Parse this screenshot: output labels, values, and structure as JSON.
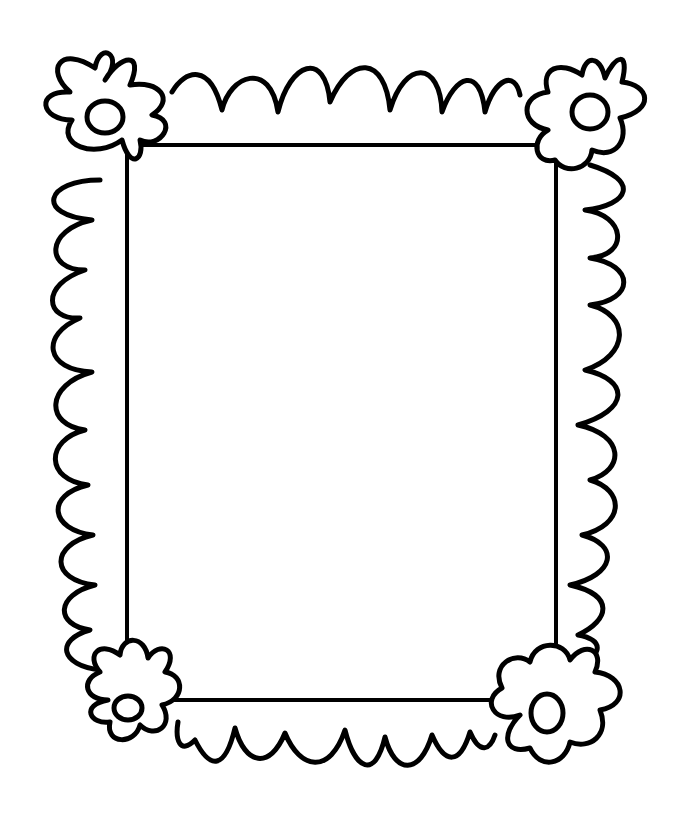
{
  "image": {
    "subject": "decorative scalloped picture frame with flowers at the four corners",
    "width": 700,
    "height": 835,
    "background": "#ffffff",
    "stroke_color": "#000000",
    "stroke_width": 5
  },
  "inner_rectangle": {
    "x": 127,
    "y": 145,
    "width": 429,
    "height": 555
  },
  "scallop_edges": {
    "top": "M 172 92 C 185 70, 210 62, 222 110 C 230 75, 270 60, 278 112 C 290 62, 325 50, 330 102 C 350 55, 385 55, 390 110 C 405 60, 440 60, 442 112 C 455 75, 480 65, 485 112 C 495 78, 515 70, 520 95",
    "bottom": "M 178 722 C 175 740, 180 755, 195 740 C 210 770, 225 770, 235 728 C 245 765, 270 770, 285 733 C 300 770, 330 775, 345 730 C 355 770, 375 780, 385 737 C 395 775, 420 775, 432 735 C 445 765, 460 765, 470 732 C 480 755, 490 750, 495 735",
    "left": "M 100 180 C 45 180, 35 215, 92 220 C 45 230, 45 270, 85 270 C 40 285, 45 320, 80 318 C 40 335, 45 370, 92 372 C 45 385, 45 425, 85 430 C 45 440, 45 480, 88 485 C 45 495, 50 530, 93 535 C 50 545, 50 580, 95 585 C 55 595, 55 625, 90 630 C 55 640, 60 665, 100 670",
    "right": "M 590 165 C 640 180, 630 205, 585 210 C 625 215, 630 255, 590 258 C 635 265, 635 300, 590 305 C 630 315, 630 355, 585 370 C 630 380, 630 410, 578 425 C 625 435, 625 470, 590 480 C 625 490, 625 525, 582 535 C 620 545, 615 575, 570 585 C 615 595, 610 620, 578 635 C 605 640, 600 655, 585 660"
  },
  "flowers": [
    {
      "name": "top-left",
      "petals": "M 122 140 C 95 160, 55 145, 72 120 C 40 120, 35 90, 70 92 C 45 70, 60 45, 95 68 C 100 40, 125 55, 105 80 C 120 55, 145 50, 130 85 C 160 80, 175 100, 152 115 C 180 120, 160 150, 140 140 C 145 160, 130 170, 122 140 Z",
      "center": {
        "cx": 105,
        "cy": 117,
        "rx": 18,
        "ry": 16
      }
    },
    {
      "name": "top-right",
      "petals": "M 548 130 C 520 125, 520 95, 548 92 C 540 68, 560 60, 582 75 C 585 55, 600 55, 605 78 C 615 55, 630 50, 622 82 C 650 85, 655 110, 620 118 C 630 140, 615 160, 592 150 C 590 170, 565 175, 555 160 C 535 165, 530 140, 548 130 Z",
      "center": {
        "cx": 590,
        "cy": 112,
        "rx": 18,
        "ry": 17
      }
    },
    {
      "name": "bottom-left",
      "petals": "M 108 700 C 85 700, 80 680, 100 672 C 85 655, 100 640, 120 655 C 122 635, 145 635, 148 658 C 160 640, 180 650, 165 672 C 185 675, 185 700, 162 705 C 175 725, 155 740, 140 725 C 135 745, 105 745, 110 722 C 90 725, 80 705, 108 700 Z",
      "center": {
        "cx": 128,
        "cy": 708,
        "rx": 14,
        "ry": 12
      }
    },
    {
      "name": "bottom-right",
      "petals": "M 520 715 C 495 725, 480 700, 502 688 C 490 665, 515 650, 530 662 C 535 640, 565 640, 570 660 C 585 640, 605 650, 595 672 C 625 675, 630 705, 600 710 C 610 735, 590 750, 570 742 C 565 765, 540 770, 530 748 C 505 755, 500 735, 520 715 Z",
      "center": {
        "cx": 547,
        "cy": 713,
        "rx": 16,
        "ry": 19
      }
    }
  ]
}
